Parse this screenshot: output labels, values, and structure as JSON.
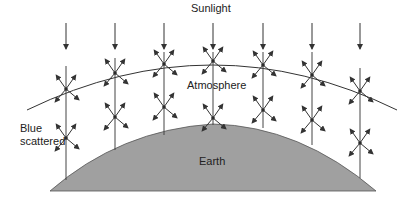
{
  "diagram": {
    "labels": {
      "sunlight": "Sunlight",
      "atmosphere": "Atmosphere",
      "blue_scattered_line1": "Blue",
      "blue_scattered_line2": "scattered",
      "earth": "Earth"
    },
    "colors": {
      "line": "#333333",
      "earth_fill": "#a0a0a0",
      "background": "#ffffff"
    },
    "columns_x": [
      66,
      115,
      164,
      213,
      263,
      312,
      360
    ],
    "scatter_points": [
      [
        66,
        89
      ],
      [
        115,
        73
      ],
      [
        164,
        64
      ],
      [
        213,
        61
      ],
      [
        263,
        65
      ],
      [
        312,
        75
      ],
      [
        360,
        91
      ],
      [
        66,
        138
      ],
      [
        115,
        117
      ],
      [
        164,
        107
      ],
      [
        213,
        118
      ],
      [
        263,
        110
      ],
      [
        312,
        120
      ],
      [
        360,
        143
      ]
    ]
  }
}
